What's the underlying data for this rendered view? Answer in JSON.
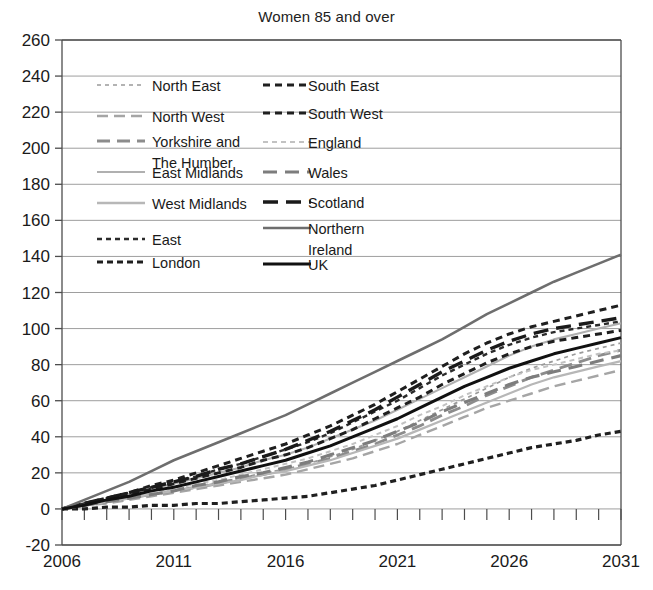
{
  "chart_data": {
    "type": "line",
    "title": "Women 85 and over",
    "xlabel": "",
    "ylabel": "",
    "xlim": [
      2006,
      2031
    ],
    "ylim": [
      -20,
      260
    ],
    "ytick_step": 20,
    "grid": true,
    "legend_position": "top-left-inside",
    "x_tick_labels": [
      "2006",
      "2011",
      "2016",
      "2021",
      "2026",
      "2031"
    ],
    "x_tick_label_years": [
      2006,
      2011,
      2016,
      2021,
      2026,
      2031
    ],
    "y_tick_labels": [
      "260",
      "240",
      "220",
      "200",
      "180",
      "160",
      "140",
      "120",
      "100",
      "80",
      "60",
      "40",
      "20",
      "0",
      "-20"
    ],
    "y_tick_values": [
      260,
      240,
      220,
      200,
      180,
      160,
      140,
      120,
      100,
      80,
      60,
      40,
      20,
      0,
      -20
    ],
    "x": [
      2006,
      2007,
      2008,
      2009,
      2010,
      2011,
      2012,
      2013,
      2014,
      2015,
      2016,
      2017,
      2018,
      2019,
      2020,
      2021,
      2022,
      2023,
      2024,
      2025,
      2026,
      2027,
      2028,
      2029,
      2030,
      2031
    ],
    "series": [
      {
        "name": "North East",
        "color": "#9a9a9a",
        "dash": "4,4",
        "width": 1.7,
        "values": [
          0,
          2,
          4,
          6,
          8,
          10,
          12,
          15,
          17,
          20,
          22,
          25,
          29,
          33,
          38,
          43,
          49,
          55,
          61,
          67,
          73,
          78,
          82,
          86,
          89,
          92
        ]
      },
      {
        "name": "North West",
        "color": "#a5a5a5",
        "dash": "11,6",
        "width": 2.4,
        "values": [
          0,
          2,
          3,
          5,
          7,
          9,
          11,
          13,
          15,
          17,
          19,
          22,
          25,
          28,
          32,
          36,
          41,
          46,
          51,
          56,
          60,
          64,
          68,
          71,
          74,
          77
        ]
      },
      {
        "name": "Yorkshire and The Humber",
        "color": "#8c8c8c",
        "dash": "13,7",
        "width": 2.9,
        "values": [
          0,
          2,
          4,
          6,
          8,
          10,
          12,
          14,
          17,
          19,
          22,
          25,
          28,
          32,
          36,
          41,
          46,
          52,
          57,
          63,
          68,
          73,
          77,
          81,
          85,
          88
        ]
      },
      {
        "name": "East Midlands",
        "color": "#b0b0b0",
        "dash": "",
        "width": 2.1,
        "values": [
          0,
          3,
          5,
          8,
          11,
          14,
          17,
          20,
          23,
          27,
          30,
          34,
          39,
          44,
          49,
          55,
          61,
          67,
          73,
          79,
          85,
          90,
          94,
          97,
          100,
          103
        ]
      },
      {
        "name": "West Midlands",
        "color": "#b7b7b7",
        "dash": "",
        "width": 2.3,
        "values": [
          0,
          2,
          4,
          6,
          8,
          10,
          12,
          14,
          16,
          19,
          21,
          24,
          27,
          31,
          35,
          39,
          44,
          49,
          54,
          59,
          64,
          69,
          73,
          76,
          79,
          82
        ]
      },
      {
        "name": "East",
        "color": "#2b2b2b",
        "dash": "5,4",
        "width": 2.4,
        "values": [
          0,
          3,
          6,
          9,
          12,
          15,
          18,
          22,
          25,
          29,
          33,
          37,
          42,
          48,
          54,
          60,
          67,
          74,
          80,
          86,
          91,
          95,
          98,
          100,
          102,
          104
        ]
      },
      {
        "name": "London",
        "color": "#1f1f1f",
        "dash": "6,4",
        "width": 3.2,
        "values": [
          0,
          0,
          1,
          1,
          2,
          2,
          3,
          3,
          4,
          5,
          6,
          7,
          9,
          11,
          13,
          16,
          19,
          22,
          25,
          28,
          31,
          34,
          36,
          38,
          41,
          43
        ]
      },
      {
        "name": "South East",
        "color": "#1f1f1f",
        "dash": "7,5",
        "width": 3.0,
        "values": [
          0,
          3,
          5,
          8,
          11,
          14,
          17,
          20,
          23,
          27,
          30,
          34,
          39,
          44,
          50,
          56,
          62,
          69,
          75,
          81,
          86,
          90,
          93,
          95,
          97,
          99
        ]
      },
      {
        "name": "South West",
        "color": "#1f1f1f",
        "dash": "7,5",
        "width": 3.0,
        "values": [
          0,
          3,
          6,
          9,
          13,
          16,
          20,
          24,
          28,
          32,
          36,
          41,
          46,
          52,
          58,
          65,
          72,
          79,
          86,
          92,
          97,
          101,
          104,
          107,
          110,
          113
        ]
      },
      {
        "name": "England",
        "color": "#c2c2c2",
        "dash": "5,4",
        "width": 2.0,
        "values": [
          0,
          2,
          4,
          6,
          9,
          11,
          14,
          16,
          19,
          22,
          25,
          28,
          32,
          36,
          41,
          46,
          52,
          57,
          63,
          68,
          73,
          77,
          80,
          83,
          86,
          88
        ]
      },
      {
        "name": "Wales",
        "color": "#7d7d7d",
        "dash": "14,8",
        "width": 3.1,
        "values": [
          0,
          2,
          4,
          6,
          8,
          10,
          13,
          15,
          18,
          20,
          23,
          26,
          30,
          34,
          38,
          43,
          48,
          54,
          59,
          64,
          69,
          73,
          76,
          79,
          82,
          85
        ]
      },
      {
        "name": "Scotland",
        "color": "#1a1a1a",
        "dash": "15,8",
        "width": 3.4,
        "values": [
          0,
          3,
          6,
          9,
          12,
          15,
          18,
          22,
          25,
          29,
          33,
          38,
          43,
          49,
          55,
          62,
          69,
          76,
          82,
          88,
          93,
          97,
          100,
          102,
          104,
          106
        ]
      },
      {
        "name": "Northern Ireland",
        "color": "#6e6e6e",
        "dash": "",
        "width": 2.6,
        "values": [
          0,
          5,
          10,
          15,
          21,
          27,
          32,
          37,
          42,
          47,
          52,
          58,
          64,
          70,
          76,
          82,
          88,
          94,
          101,
          108,
          114,
          120,
          126,
          131,
          136,
          141
        ]
      },
      {
        "name": "UK",
        "color": "#111111",
        "dash": "",
        "width": 3.0,
        "values": [
          0,
          2,
          5,
          7,
          10,
          12,
          15,
          18,
          21,
          24,
          27,
          31,
          35,
          40,
          45,
          50,
          56,
          62,
          68,
          73,
          78,
          82,
          86,
          89,
          92,
          95
        ]
      }
    ],
    "legend": {
      "columns": [
        [
          {
            "label": "North East",
            "style_ref": "North East"
          },
          {
            "label": "North West",
            "style_ref": "North West"
          },
          {
            "label": "Yorkshire and The Humber",
            "style_ref": "Yorkshire and The Humber"
          },
          {
            "label": "East Midlands",
            "style_ref": "East Midlands"
          },
          {
            "label": "West Midlands",
            "style_ref": "West Midlands"
          },
          {
            "label": "East",
            "style_ref": "East"
          },
          {
            "label": "London",
            "style_ref": "London"
          }
        ],
        [
          {
            "label": "South East",
            "style_ref": "South East"
          },
          {
            "label": "South West",
            "style_ref": "South West"
          },
          {
            "label": "England",
            "style_ref": "England"
          },
          {
            "label": "Wales",
            "style_ref": "Wales"
          },
          {
            "label": "Scotland",
            "style_ref": "Scotland"
          },
          {
            "label": "Northern Ireland",
            "style_ref": "Northern Ireland"
          },
          {
            "label": "UK",
            "style_ref": "UK"
          }
        ]
      ]
    }
  },
  "colors": {
    "axis": "#4d4d4d",
    "grid": "#9e9e9e",
    "text": "#1a1a1a",
    "background": "#ffffff"
  }
}
